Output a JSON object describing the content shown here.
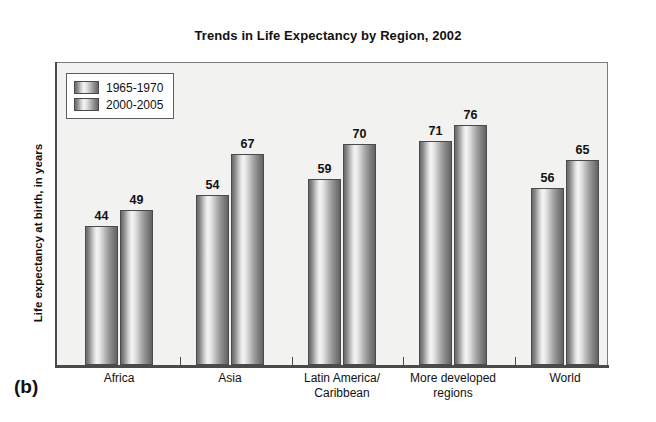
{
  "figure": {
    "panel_label": "(b)",
    "title": "Trends in Life Expectancy by Region, 2002"
  },
  "axes": {
    "ylabel": "Life expectancy at birth, in years"
  },
  "legend": {
    "items": [
      {
        "label": "1965-1970",
        "swatch": "cylinder-gray-swatch"
      },
      {
        "label": "2000-2005",
        "swatch": "cylinder-gray-swatch"
      }
    ]
  },
  "chart_data": {
    "type": "bar",
    "title": "Trends in Life Expectancy by Region, 2002",
    "xlabel": "",
    "ylabel": "Life expectancy at birth, in years",
    "ylim": [
      0,
      96
    ],
    "grid": false,
    "legend_position": "top-left-inside",
    "categories": [
      "Africa",
      "Asia",
      "Latin America/\nCaribbean",
      "More developed\nregions",
      "World"
    ],
    "category_lines": [
      [
        "Africa",
        ""
      ],
      [
        "Asia",
        ""
      ],
      [
        "Latin America/",
        "Caribbean"
      ],
      [
        "More developed",
        "regions"
      ],
      [
        "World",
        ""
      ]
    ],
    "series": [
      {
        "name": "1965-1970",
        "values": [
          44,
          54,
          59,
          71,
          56
        ]
      },
      {
        "name": "2000-2005",
        "values": [
          49,
          67,
          70,
          76,
          65
        ]
      }
    ],
    "value_labels": {
      "africa": [
        "44",
        "49"
      ],
      "asia": [
        "54",
        "67"
      ],
      "latin_america_caribbean": [
        "59",
        "70"
      ],
      "more_developed_regions": [
        "71",
        "76"
      ],
      "world": [
        "56",
        "65"
      ]
    }
  },
  "colors": {
    "page_background": "#ffffff",
    "plot_background": "#f2f2f0",
    "frame_border": "#7c7c7c",
    "axis_line": "#4a4a4a",
    "bar_edge": "#4a4a4a",
    "bar_highlight": "#f2f2f2",
    "bar_shadow": "#636363",
    "text": "#111111"
  }
}
